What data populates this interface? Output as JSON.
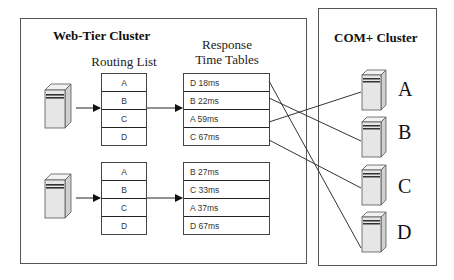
{
  "web_tier": {
    "title": "Web-Tier Cluster",
    "routing_caption": "Routing List",
    "response_caption_line1": "Response",
    "response_caption_line2": "Time Tables",
    "groups": [
      {
        "routing_list": [
          "A",
          "B",
          "C",
          "D"
        ],
        "response_times": [
          "D 18ms",
          "B 22ms",
          "A 59ms",
          "C 67ms"
        ]
      },
      {
        "routing_list": [
          "A",
          "B",
          "C",
          "D"
        ],
        "response_times": [
          "B 27ms",
          "C 33ms",
          "A 37ms",
          "D 67ms"
        ]
      }
    ]
  },
  "com_cluster": {
    "title": "COM+ Cluster",
    "servers": [
      {
        "label": "A"
      },
      {
        "label": "B"
      },
      {
        "label": "C"
      },
      {
        "label": "D"
      }
    ]
  },
  "connections": [
    {
      "from": "D 18ms",
      "to": "D"
    },
    {
      "from": "B 22ms",
      "to": "B"
    },
    {
      "from": "A 59ms",
      "to": "A"
    },
    {
      "from": "C 67ms",
      "to": "C"
    }
  ],
  "colors": {
    "line": "#333333",
    "server_face": "#e6e6e6",
    "server_side": "#cfcfcf",
    "server_top": "#f2f2f2"
  }
}
